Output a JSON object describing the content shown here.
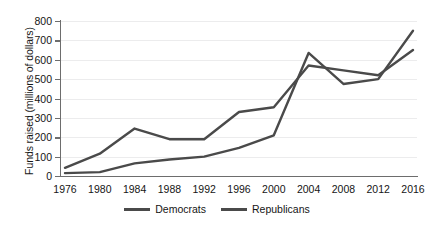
{
  "chart_data": {
    "type": "line",
    "title": "",
    "xlabel": "",
    "ylabel": "Funds raised (millions of dollars)",
    "categories": [
      1976,
      1980,
      1984,
      1988,
      1992,
      1996,
      2000,
      2004,
      2008,
      2012,
      2016
    ],
    "x_tick_labels": [
      "1976",
      "1980",
      "1984",
      "1988",
      "1992",
      "1996",
      "2000",
      "2004",
      "2008",
      "2012",
      "2016"
    ],
    "y_tick_labels": [
      "0",
      "100",
      "200",
      "300",
      "400",
      "500",
      "600",
      "700",
      "800"
    ],
    "y_ticks": [
      0,
      100,
      200,
      300,
      400,
      500,
      600,
      700,
      800
    ],
    "ylim": [
      0,
      800
    ],
    "grid": true,
    "grid_axis": "y",
    "legend_position": "bottom",
    "series": [
      {
        "name": "Democrats",
        "color": "#4a4a4a",
        "values": [
          15,
          20,
          65,
          85,
          100,
          145,
          210,
          635,
          475,
          500,
          750
        ]
      },
      {
        "name": "Republicans",
        "color": "#4a4a4a",
        "values": [
          42,
          115,
          245,
          190,
          190,
          330,
          355,
          570,
          545,
          520,
          650
        ]
      }
    ]
  },
  "legend": {
    "items": [
      {
        "label": "Democrats",
        "color": "#4a4a4a"
      },
      {
        "label": "Republicans",
        "color": "#4a4a4a"
      }
    ]
  }
}
